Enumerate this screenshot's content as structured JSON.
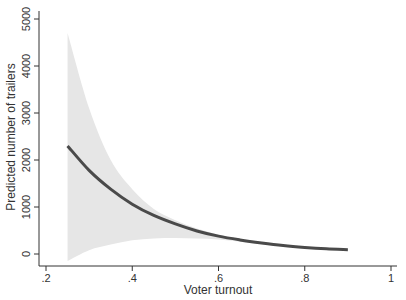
{
  "chart_data": {
    "type": "line",
    "title": "",
    "xlabel": "Voter turnout",
    "ylabel": "Predicted number of trailers",
    "xlim": [
      0.2,
      1.0
    ],
    "ylim": [
      -300,
      5000
    ],
    "x_ticks": [
      0.2,
      0.4,
      0.6,
      0.8,
      1.0
    ],
    "x_tick_labels": [
      ".2",
      ".4",
      ".6",
      ".8",
      "1"
    ],
    "y_ticks": [
      0,
      1000,
      2000,
      3000,
      4000,
      5000
    ],
    "y_tick_labels": [
      "0",
      "1000",
      "2000",
      "3000",
      "4000",
      "5000"
    ],
    "grid": false,
    "legend": null,
    "x": [
      0.25,
      0.3,
      0.35,
      0.4,
      0.45,
      0.5,
      0.55,
      0.6,
      0.65,
      0.7,
      0.75,
      0.8,
      0.85,
      0.9
    ],
    "series": [
      {
        "name": "Predicted number of trailers",
        "values": [
          2300,
          1780,
          1380,
          1060,
          820,
          640,
          490,
          380,
          300,
          235,
          180,
          140,
          110,
          90
        ],
        "color": "#4a4a4a"
      }
    ],
    "confidence_band": {
      "upper": [
        4700,
        3100,
        2000,
        1380,
        960,
        720,
        540,
        410,
        320,
        255,
        195,
        152,
        120,
        98
      ],
      "lower": [
        -150,
        80,
        200,
        290,
        330,
        340,
        330,
        310,
        260,
        210,
        160,
        125,
        98,
        80
      ],
      "color": "#e6e6e6"
    }
  },
  "colors": {
    "line": "#4a4a4a",
    "band": "#e6e6e6",
    "axis": "#333333",
    "background": "#ffffff"
  }
}
